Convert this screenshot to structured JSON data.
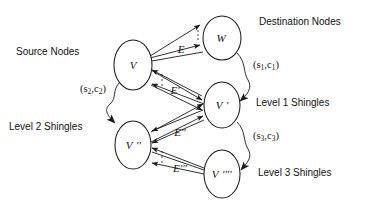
{
  "figure": {
    "background_color": "#ffffff",
    "ink_color": "#1a1a1a"
  },
  "annotations": {
    "source_nodes": "Source Nodes",
    "destination_nodes": "Destination Nodes",
    "level1": "Level 1 Shingles",
    "level2": "Level 2 Shingles",
    "level3": "Level 3 Shingles"
  },
  "nodes": [
    {
      "id": "V",
      "label": "V",
      "primes": "",
      "cx": 133,
      "cy": 65,
      "rx": 19,
      "ry": 25
    },
    {
      "id": "W",
      "label": "W",
      "primes": "",
      "cx": 222,
      "cy": 38,
      "rx": 19,
      "ry": 22
    },
    {
      "id": "Vp",
      "label": "V",
      "primes": "′",
      "cx": 222,
      "cy": 105,
      "rx": 18,
      "ry": 23
    },
    {
      "id": "Vpp",
      "label": "V",
      "primes": "′′",
      "cx": 133,
      "cy": 145,
      "rx": 18,
      "ry": 24
    },
    {
      "id": "Vpppp",
      "label": "V",
      "primes": "′′′′",
      "cx": 222,
      "cy": 174,
      "rx": 18,
      "ry": 24
    }
  ],
  "edge_groups": [
    {
      "id": "E",
      "label": "E",
      "label_x": 181,
      "label_y": 53,
      "from": "V",
      "to": "W"
    },
    {
      "id": "Ep",
      "label": "E′",
      "label_x": 175,
      "label_y": 94,
      "from": "V",
      "to": "Vp"
    },
    {
      "id": "Epp",
      "label": "E′′",
      "label_x": 180,
      "label_y": 136,
      "from": "Vpp",
      "to": "Vp"
    },
    {
      "id": "Eppp",
      "label": "E′′′",
      "label_x": 180,
      "label_y": 172,
      "from": "Vpppp",
      "to": "Vpp"
    }
  ],
  "pair_labels": [
    {
      "id": "p1",
      "prefix": "(s",
      "sub1": "1",
      "mid": ",c",
      "sub2": "1",
      "suffix": ")",
      "x": 253,
      "y": 68
    },
    {
      "id": "p2",
      "prefix": "(s",
      "sub1": "2",
      "mid": ",c",
      "sub2": "2",
      "suffix": ")",
      "x": 80,
      "y": 92
    },
    {
      "id": "p3",
      "prefix": "(s",
      "sub1": "3",
      "mid": ",c",
      "sub2": "3",
      "suffix": ")",
      "x": 253,
      "y": 139
    }
  ]
}
